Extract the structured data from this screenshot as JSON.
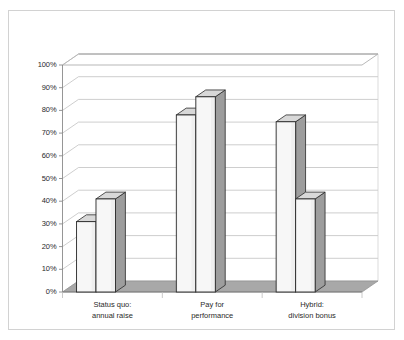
{
  "figure": {
    "background_color": "#ffffff",
    "frame_color": "#d2d2d2",
    "plot_area_color": "#ffffff",
    "gridline_color": "#9a9a9a",
    "axis_color": "#8a8a8a",
    "floor_color": "#a8a8a8",
    "bar_face_color": "#efefef",
    "bar_side_color": "#9d9d9d",
    "bar_top_color": "#d8d8d8",
    "bar_outline_color": "#2a2a2a"
  },
  "chart_data": {
    "type": "bar",
    "title": "",
    "subtitle": "",
    "xlabel": "",
    "ylabel": "",
    "categories": [
      "Status quo: annual raise",
      "Pay for performance",
      "Hybrid: division bonus"
    ],
    "category_lines": [
      [
        "Status quo:",
        "annual raise"
      ],
      [
        "Pay for",
        "performance"
      ],
      [
        "Hybrid:",
        "division bonus"
      ]
    ],
    "series": [
      {
        "name": "Series 1",
        "values": [
          31,
          78,
          75
        ]
      },
      {
        "name": "Series 2",
        "values": [
          41,
          86,
          41
        ]
      }
    ],
    "ylim": [
      0,
      100
    ],
    "ytick_values": [
      0,
      10,
      20,
      30,
      40,
      50,
      60,
      70,
      80,
      90,
      100
    ],
    "ytick_labels": [
      "0%",
      "10%",
      "20%",
      "30%",
      "40%",
      "50%",
      "60%",
      "70%",
      "80%",
      "90%",
      "100%"
    ],
    "grid": true,
    "grid_axis": "y",
    "legend": false,
    "legend_position": "none",
    "style": "3d-column",
    "value_format": "percent"
  }
}
